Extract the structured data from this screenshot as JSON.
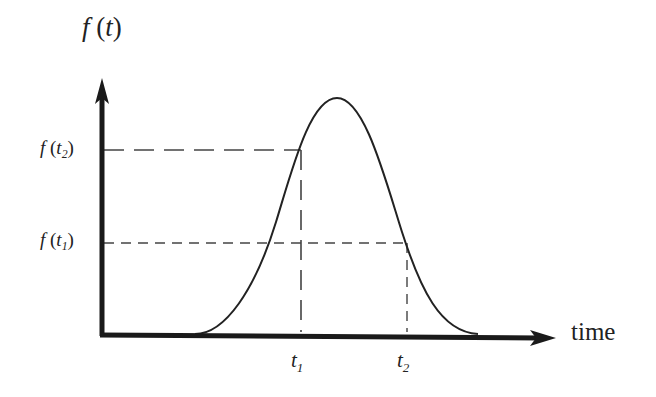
{
  "diagram": {
    "title": "",
    "y_axis": {
      "label_func": "f",
      "label_open": " (",
      "label_var": "t",
      "label_close": ")"
    },
    "x_axis": {
      "label": "time"
    },
    "y_markers": [
      {
        "func": "f",
        "open": " (",
        "var": "t",
        "sub": "2",
        "close": ")"
      },
      {
        "func": "f",
        "open": " (",
        "var": "t",
        "sub": "1",
        "close": ")"
      }
    ],
    "x_markers": [
      {
        "var": "t",
        "sub": "1"
      },
      {
        "var": "t",
        "sub": "2"
      }
    ],
    "colors": {
      "axis": "#1a1a1a",
      "curve": "#222222",
      "dashed": "#444444",
      "text": "#222222",
      "background": "#ffffff"
    },
    "curve_description": "bell-shaped pulse rising from baseline near x=195, peaking near x=337, returning to baseline near x=478"
  }
}
